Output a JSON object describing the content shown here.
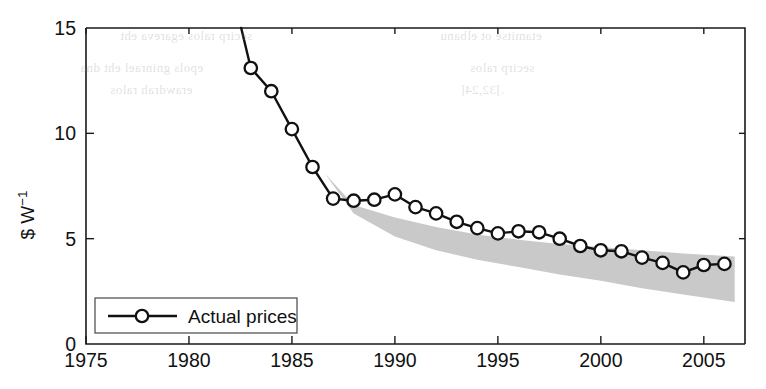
{
  "chart_data": {
    "type": "line",
    "title": "",
    "xlabel": "",
    "ylabel": "$ W−1",
    "ylabel_display": "$ W",
    "ylabel_exponent": "−1",
    "xlim": [
      1975,
      2007
    ],
    "ylim": [
      0,
      15
    ],
    "xticks": [
      1975,
      1980,
      1985,
      1990,
      1995,
      2000,
      2005
    ],
    "xticklabels": [
      "1975",
      "1980",
      "1985",
      "1990",
      "1995",
      "2000",
      "2005"
    ],
    "yticks": [
      0,
      5,
      10,
      15
    ],
    "yticklabels": [
      "0",
      "5",
      "10",
      "15"
    ],
    "grid": false,
    "legend_position": "bottom-left",
    "series": [
      {
        "name": "Actual prices",
        "marker": "circle-open",
        "x": [
          1982,
          1983,
          1984,
          1985,
          1986,
          1987,
          1988,
          1989,
          1990,
          1991,
          1992,
          1993,
          1994,
          1995,
          1996,
          1997,
          1998,
          1999,
          2000,
          2001,
          2002,
          2003,
          2004,
          2005,
          2006
        ],
        "values": [
          17.2,
          13.1,
          12.0,
          10.2,
          8.4,
          6.9,
          6.8,
          6.85,
          7.1,
          6.5,
          6.2,
          5.8,
          5.5,
          5.25,
          5.35,
          5.3,
          5.0,
          4.65,
          4.45,
          4.4,
          4.1,
          3.85,
          3.4,
          3.75,
          3.8
        ]
      }
    ],
    "band": {
      "name": "price forecast range",
      "color": "#c9c9c9",
      "x": [
        1986.6,
        1988,
        1990,
        1992,
        1994,
        1996,
        1998,
        2000,
        2002,
        2004,
        2006.5
      ],
      "upper": [
        8.1,
        6.6,
        6.0,
        5.55,
        5.2,
        4.95,
        4.75,
        4.6,
        4.45,
        4.3,
        4.15
      ],
      "lower": [
        8.1,
        6.2,
        5.1,
        4.45,
        4.0,
        3.65,
        3.3,
        3.0,
        2.65,
        2.35,
        2.0
      ]
    }
  },
  "legend": {
    "entries": [
      {
        "label": "Actual prices",
        "marker": "circle-open"
      }
    ]
  },
  "bleed_through": [
    {
      "text": "secirp ralos egareva eht",
      "x": 120,
      "y": 28
    },
    {
      "text": "etamitse ot elbanu",
      "x": 440,
      "y": 28
    },
    {
      "text": "epols gninrael eht dna",
      "x": 80,
      "y": 60
    },
    {
      "text": "secirp ralos",
      "x": 470,
      "y": 60
    },
    {
      "text": "erawdrah ralos",
      "x": 110,
      "y": 82
    },
    {
      "text": ".]32,24[",
      "x": 460,
      "y": 82
    }
  ]
}
